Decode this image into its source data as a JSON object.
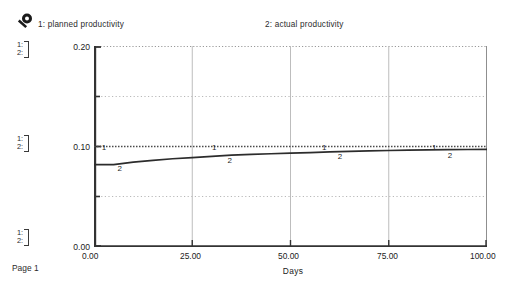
{
  "page": {
    "footer_label": "Page 1",
    "icon": "magnifier-icon"
  },
  "legend": {
    "entries": [
      {
        "key": "1",
        "label": "1: planned productivity"
      },
      {
        "key": "2",
        "label": "2: actual productivity"
      }
    ]
  },
  "scale_groups": [
    {
      "line1": "1:",
      "line2": "2:"
    },
    {
      "line1": "1:",
      "line2": "2:"
    },
    {
      "line1": "1:",
      "line2": "2:"
    }
  ],
  "axes": {
    "y_ticks": [
      "0.20",
      "0.10",
      "0.00"
    ],
    "x_ticks": [
      "0.00",
      "25.00",
      "50.00",
      "75.00",
      "100.00"
    ],
    "x_title": "Days"
  },
  "colors": {
    "line1": "#4a4a4a",
    "line2": "#2c2c2c",
    "grid": "#b9b9b9",
    "axis": "#333333"
  },
  "chart_data": {
    "type": "line",
    "title": "",
    "xlabel": "Days",
    "ylabel": "",
    "xlim": [
      0,
      100
    ],
    "ylim": [
      0,
      0.2
    ],
    "x_ticks": [
      0,
      25,
      50,
      75,
      100
    ],
    "y_ticks": [
      0,
      0.05,
      0.1,
      0.15,
      0.2
    ],
    "y_ticklabels": [
      "0.00",
      "",
      "0.10",
      "",
      "0.20"
    ],
    "grid": true,
    "grid_style": "dotted-horizontal solid-vertical",
    "legend_position": "top",
    "series": [
      {
        "name": "planned productivity",
        "key": "1",
        "style": "dotted",
        "marker_labels": [
          {
            "x": 2,
            "y": 0.1
          },
          {
            "x": 30,
            "y": 0.1
          },
          {
            "x": 58,
            "y": 0.1
          },
          {
            "x": 86,
            "y": 0.1
          }
        ],
        "x": [
          0,
          10,
          20,
          30,
          40,
          50,
          60,
          70,
          80,
          90,
          100
        ],
        "values": [
          0.1,
          0.1,
          0.1,
          0.1,
          0.1,
          0.1,
          0.1,
          0.1,
          0.1,
          0.1,
          0.1
        ]
      },
      {
        "name": "actual productivity",
        "key": "2",
        "style": "solid",
        "marker_labels": [
          {
            "x": 6,
            "y": 0.0835
          },
          {
            "x": 34,
            "y": 0.0915
          },
          {
            "x": 62,
            "y": 0.0952
          },
          {
            "x": 90,
            "y": 0.0968
          }
        ],
        "x": [
          0,
          5,
          10,
          15,
          20,
          25,
          30,
          35,
          40,
          45,
          50,
          55,
          60,
          65,
          70,
          75,
          80,
          85,
          90,
          95,
          100
        ],
        "values": [
          0.082,
          0.082,
          0.0845,
          0.0862,
          0.0878,
          0.089,
          0.0902,
          0.0915,
          0.0922,
          0.0928,
          0.0934,
          0.094,
          0.0946,
          0.0952,
          0.0956,
          0.096,
          0.0963,
          0.0966,
          0.0968,
          0.097,
          0.0972
        ]
      }
    ]
  }
}
